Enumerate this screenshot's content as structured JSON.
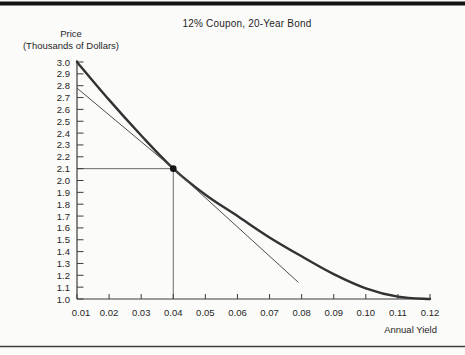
{
  "figure": {
    "title": "12% Coupon, 20-Year Bond",
    "y_axis_title_line1": "Price",
    "y_axis_title_line2": "(Thousands of Dollars)",
    "x_axis_title": "Annual Yield"
  },
  "chart_data": {
    "type": "line",
    "title": "12% Coupon, 20-Year Bond",
    "xlabel": "Annual Yield",
    "ylabel": "Price (Thousands of Dollars)",
    "xlim": [
      0.01,
      0.12
    ],
    "ylim": [
      1.0,
      3.0
    ],
    "grid": false,
    "legend": "none",
    "x_ticks": [
      {
        "v": 0.01,
        "label": "0.01"
      },
      {
        "v": 0.02,
        "label": "0.02"
      },
      {
        "v": 0.03,
        "label": "0.03"
      },
      {
        "v": 0.04,
        "label": "0.04"
      },
      {
        "v": 0.05,
        "label": "0.05"
      },
      {
        "v": 0.06,
        "label": "0.06"
      },
      {
        "v": 0.07,
        "label": "0.07"
      },
      {
        "v": 0.08,
        "label": "0.08"
      },
      {
        "v": 0.09,
        "label": "0.09"
      },
      {
        "v": 0.1,
        "label": "0.10"
      },
      {
        "v": 0.11,
        "label": "0.11"
      },
      {
        "v": 0.12,
        "label": "0.12"
      }
    ],
    "y_ticks": [
      {
        "v": 3.0,
        "label": "3.0"
      },
      {
        "v": 2.9,
        "label": "2.9"
      },
      {
        "v": 2.8,
        "label": "2.8"
      },
      {
        "v": 2.7,
        "label": "2.7"
      },
      {
        "v": 2.6,
        "label": "2.6"
      },
      {
        "v": 2.5,
        "label": "2.5"
      },
      {
        "v": 2.4,
        "label": "2.4"
      },
      {
        "v": 2.3,
        "label": "2.3"
      },
      {
        "v": 2.2,
        "label": "2.2"
      },
      {
        "v": 2.1,
        "label": "2.1"
      },
      {
        "v": 2.0,
        "label": "2.0"
      },
      {
        "v": 1.9,
        "label": "1.9"
      },
      {
        "v": 1.8,
        "label": "1.8"
      },
      {
        "v": 1.7,
        "label": "1.7"
      },
      {
        "v": 1.6,
        "label": "1.6"
      },
      {
        "v": 1.5,
        "label": "1.5"
      },
      {
        "v": 1.4,
        "label": "1.4"
      },
      {
        "v": 1.3,
        "label": "1.3"
      },
      {
        "v": 1.2,
        "label": "1.2"
      },
      {
        "v": 1.1,
        "label": "1.1"
      },
      {
        "v": 1.0,
        "label": "1.0"
      }
    ],
    "series": [
      {
        "name": "price-yield-curve",
        "style": "curve",
        "x": [
          0.01,
          0.02,
          0.03,
          0.04,
          0.05,
          0.06,
          0.07,
          0.08,
          0.09,
          0.1,
          0.11,
          0.12
        ],
        "y": [
          3.0,
          2.68,
          2.38,
          2.1,
          1.88,
          1.7,
          1.52,
          1.36,
          1.21,
          1.09,
          1.02,
          1.0
        ]
      },
      {
        "name": "tangent-line",
        "style": "straight",
        "x": [
          0.01,
          0.04,
          0.079
        ],
        "y": [
          2.78,
          2.1,
          1.14
        ]
      }
    ],
    "marked_point": {
      "x": 0.04,
      "y": 2.1
    }
  },
  "colors": {
    "background": "#fbfbfa",
    "top_rule": "#131313",
    "bottom_rule": "#3c3c3c",
    "axis": "#3c3c3c",
    "curve": "#323232",
    "tangent": "#4d4d4d",
    "guide": "#5a5a5a",
    "dot": "#151515",
    "text": "#1f1f1f"
  }
}
